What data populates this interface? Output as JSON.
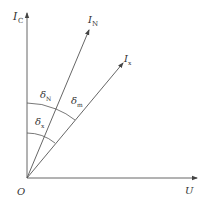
{
  "diagram": {
    "type": "phasor-diagram",
    "origin_label": "O",
    "axes": {
      "vertical": {
        "label": "I",
        "subscript": "C"
      },
      "horizontal": {
        "label": "U",
        "subscript": ""
      }
    },
    "vectors": [
      {
        "id": "IN",
        "label": "I",
        "subscript": "N"
      },
      {
        "id": "Ix",
        "label": "I",
        "subscript": "x"
      }
    ],
    "angles": [
      {
        "id": "deltaN",
        "label": "δ",
        "subscript": "N",
        "between": [
          "I_C",
          "I_N"
        ]
      },
      {
        "id": "deltam",
        "label": "δ",
        "subscript": "m",
        "between": [
          "I_N",
          "I_x"
        ]
      },
      {
        "id": "deltax",
        "label": "δ",
        "subscript": "x",
        "between": [
          "I_C",
          "I_x"
        ]
      }
    ],
    "colors": {
      "line": "#555555",
      "text": "#333333"
    }
  }
}
